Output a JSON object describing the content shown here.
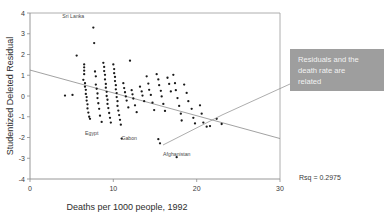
{
  "chart_data": {
    "type": "scatter",
    "title": "",
    "xlabel": "Deaths per 1000 people, 1992",
    "ylabel": "Studentized Deleted Residual",
    "xlim": [
      0,
      30
    ],
    "ylim": [
      -4,
      4
    ],
    "xticks": [
      0,
      10,
      20,
      30
    ],
    "yticks": [
      -4,
      -3,
      -2,
      -1,
      0,
      1,
      2,
      3,
      4
    ],
    "xtick_labels": [
      "0",
      "10",
      "20",
      "30"
    ],
    "ytick_labels": [
      "-4",
      "-3",
      "-2",
      "-1",
      "0",
      "1",
      "2",
      "3",
      "4"
    ],
    "grid": false,
    "legend": false,
    "fit_line": {
      "x": [
        0,
        30
      ],
      "y": [
        1.25,
        -2.05
      ],
      "label": "least-squares fit"
    },
    "rsq_text": "Rsq = 0.2975",
    "rsq_value": 0.2975,
    "points": [
      [
        4.2,
        0.02
      ],
      [
        5.1,
        0.05
      ],
      [
        5.6,
        1.95
      ],
      [
        6.4,
        0.78
      ],
      [
        6.5,
        1.52
      ],
      [
        6.5,
        1.38
      ],
      [
        6.5,
        1.22
      ],
      [
        6.5,
        1.05
      ],
      [
        6.6,
        0.62
      ],
      [
        6.6,
        0.45
      ],
      [
        6.7,
        0.3
      ],
      [
        6.7,
        0.1
      ],
      [
        6.8,
        -0.05
      ],
      [
        6.8,
        -0.22
      ],
      [
        6.9,
        -0.4
      ],
      [
        6.9,
        -0.6
      ],
      [
        7.0,
        -0.8
      ],
      [
        7.1,
        -1.0
      ],
      [
        7.2,
        -1.1
      ],
      [
        7.6,
        3.3
      ],
      [
        7.7,
        2.55
      ],
      [
        7.8,
        1.18
      ],
      [
        7.9,
        0.95
      ],
      [
        7.9,
        0.55
      ],
      [
        8.0,
        0.35
      ],
      [
        8.1,
        0.12
      ],
      [
        8.1,
        -0.1
      ],
      [
        8.2,
        -0.35
      ],
      [
        8.3,
        -0.62
      ],
      [
        8.4,
        -0.95
      ],
      [
        8.6,
        -1.25
      ],
      [
        8.8,
        1.6
      ],
      [
        8.9,
        1.4
      ],
      [
        8.9,
        1.2
      ],
      [
        9.0,
        1.02
      ],
      [
        9.0,
        0.8
      ],
      [
        9.1,
        0.58
      ],
      [
        9.1,
        0.4
      ],
      [
        9.2,
        0.2
      ],
      [
        9.2,
        0.0
      ],
      [
        9.3,
        -0.18
      ],
      [
        9.3,
        -0.38
      ],
      [
        9.4,
        -0.58
      ],
      [
        9.5,
        -0.82
      ],
      [
        9.6,
        -1.05
      ],
      [
        9.7,
        -1.28
      ],
      [
        10.0,
        1.52
      ],
      [
        10.1,
        1.3
      ],
      [
        10.1,
        1.1
      ],
      [
        10.2,
        0.92
      ],
      [
        10.2,
        0.72
      ],
      [
        10.3,
        0.52
      ],
      [
        10.3,
        0.32
      ],
      [
        10.4,
        0.14
      ],
      [
        10.4,
        -0.05
      ],
      [
        10.5,
        -0.25
      ],
      [
        10.5,
        -0.48
      ],
      [
        10.6,
        -0.7
      ],
      [
        10.7,
        -0.92
      ],
      [
        10.8,
        -1.15
      ],
      [
        10.9,
        -1.38
      ],
      [
        11.0,
        -2.05
      ],
      [
        11.2,
        0.62
      ],
      [
        11.3,
        0.38
      ],
      [
        11.4,
        0.18
      ],
      [
        11.5,
        -0.02
      ],
      [
        11.6,
        -0.22
      ],
      [
        11.8,
        -0.55
      ],
      [
        12.0,
        1.7
      ],
      [
        12.2,
        0.28
      ],
      [
        12.3,
        0.08
      ],
      [
        12.4,
        -0.12
      ],
      [
        12.6,
        -0.45
      ],
      [
        12.8,
        -0.78
      ],
      [
        13.2,
        0.45
      ],
      [
        13.4,
        0.22
      ],
      [
        13.5,
        0.02
      ],
      [
        13.7,
        -0.25
      ],
      [
        14.0,
        0.95
      ],
      [
        14.2,
        0.6
      ],
      [
        14.3,
        0.3
      ],
      [
        14.5,
        0.05
      ],
      [
        14.7,
        -0.32
      ],
      [
        14.9,
        -0.68
      ],
      [
        15.2,
        1.05
      ],
      [
        15.4,
        0.8
      ],
      [
        15.5,
        0.52
      ],
      [
        15.7,
        0.25
      ],
      [
        15.8,
        -0.02
      ],
      [
        16.0,
        -0.38
      ],
      [
        16.2,
        -0.72
      ],
      [
        16.5,
        0.88
      ],
      [
        16.7,
        0.58
      ],
      [
        16.9,
        0.22
      ],
      [
        17.2,
        1.02
      ],
      [
        17.4,
        0.62
      ],
      [
        17.5,
        0.28
      ],
      [
        17.7,
        -0.1
      ],
      [
        17.9,
        -0.48
      ],
      [
        18.1,
        -0.85
      ],
      [
        18.2,
        -1.18
      ],
      [
        15.4,
        -2.08
      ],
      [
        15.6,
        -2.28
      ],
      [
        18.5,
        0.55
      ],
      [
        18.8,
        0.15
      ],
      [
        19.0,
        -0.25
      ],
      [
        19.4,
        -0.62
      ],
      [
        19.6,
        -1.05
      ],
      [
        19.8,
        -1.32
      ],
      [
        17.6,
        -2.95
      ],
      [
        20.4,
        -0.45
      ],
      [
        20.6,
        -0.85
      ],
      [
        20.8,
        -1.28
      ],
      [
        21.2,
        -1.48
      ],
      [
        21.6,
        -1.45
      ],
      [
        22.4,
        -1.1
      ],
      [
        23.0,
        -1.35
      ]
    ],
    "annotations": [
      {
        "label": "Sri Lanka",
        "x": 7.6,
        "y": 3.3
      },
      {
        "label": "Egypt",
        "x": 11.0,
        "y": -2.05
      },
      {
        "label": "Gabon",
        "x": 15.5,
        "y": -2.2
      },
      {
        "label": "Afghanistan",
        "x": 17.6,
        "y": -2.95
      }
    ]
  },
  "callout": {
    "text_line1": "Residuals and the",
    "text_line2": "death rate are",
    "text_line3": "related",
    "full_text": "Residuals and the death rate are related",
    "background_color": "#9e9e9e",
    "text_color": "#f2f2f2"
  },
  "axes": {
    "x_title": "Deaths per 1000 people, 1992",
    "y_title": "Studentized Deleted Residual",
    "x_tick_0": "0",
    "x_tick_1": "10",
    "x_tick_2": "20",
    "x_tick_3": "30",
    "y_tick_m4": "-4",
    "y_tick_m3": "-3",
    "y_tick_m2": "-2",
    "y_tick_m1": "-1",
    "y_tick_0": "0",
    "y_tick_1": "1",
    "y_tick_2": "2",
    "y_tick_3": "3",
    "y_tick_4": "4"
  },
  "stats": {
    "rsq": "Rsq = 0.2975"
  },
  "labels": {
    "sri_lanka": "Sri Lanka",
    "egypt": "Egypt",
    "gabon": "Gabon",
    "afghanistan": "Afghanistan"
  }
}
